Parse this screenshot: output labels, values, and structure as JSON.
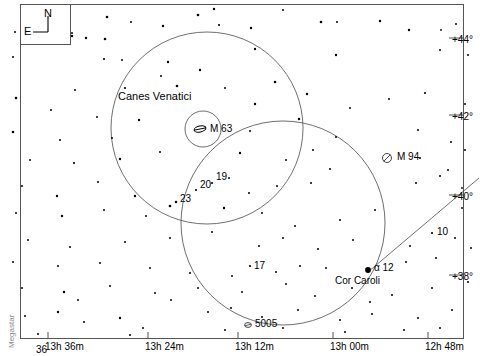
{
  "chart": {
    "width": 488,
    "height": 356,
    "background": "#ffffff",
    "ink": "#000000",
    "watermark": "Megastar"
  },
  "compass": {
    "north_label": "N",
    "east_label": "E"
  },
  "constellation": {
    "name": "Canes Venatici"
  },
  "deep_sky": [
    {
      "id": "m63",
      "label": "M 63",
      "symbol": "galaxy-edge-on",
      "x": 200,
      "y": 129,
      "label_x": 210,
      "label_y": 124
    },
    {
      "id": "m94",
      "label": "M 94",
      "symbol": "galaxy-slashed",
      "x": 387,
      "y": 158,
      "label_x": 397,
      "label_y": 152
    },
    {
      "id": "n5005",
      "label": "5005",
      "symbol": "galaxy-small",
      "x": 248,
      "y": 325,
      "label_x": 255,
      "label_y": 319
    }
  ],
  "stars_labeled": [
    {
      "label": "19",
      "x": 212,
      "y": 183,
      "mag": 5.4,
      "label_x": 216,
      "label_y": 172
    },
    {
      "label": "20",
      "x": 196,
      "y": 190,
      "mag": 5.2,
      "label_x": 200,
      "label_y": 180
    },
    {
      "label": "23",
      "x": 176,
      "y": 202,
      "mag": 5.0,
      "label_x": 180,
      "label_y": 194
    },
    {
      "label": "17",
      "x": 250,
      "y": 266,
      "mag": 5.4,
      "label_x": 254,
      "label_y": 261
    },
    {
      "label": "10",
      "x": 432,
      "y": 233,
      "mag": 5.9,
      "label_x": 437,
      "label_y": 227
    },
    {
      "label": "α  12",
      "x": 368,
      "y": 270,
      "mag": 2.9,
      "label_x": 374,
      "label_y": 263
    }
  ],
  "named_stars": [
    {
      "name": "Cor Caroli",
      "x": 368,
      "y": 270,
      "label_x": 335,
      "label_y": 276
    }
  ],
  "axis_ra": {
    "label": "Right Ascension",
    "ticks": [
      {
        "text": "13h 36m",
        "x": 48,
        "y": 342
      },
      {
        "text": "13h 24m",
        "x": 148,
        "y": 342
      },
      {
        "text": "13h 12m",
        "x": 238,
        "y": 342
      },
      {
        "text": "13h 00m",
        "x": 333,
        "y": 342
      },
      {
        "text": "12h 48m",
        "x": 428,
        "y": 342
      }
    ],
    "extra_tick": {
      "text": "36",
      "x": 36,
      "y": 345
    }
  },
  "axis_dec": {
    "label": "Declination",
    "ticks": [
      {
        "text": "+44°",
        "x": 452,
        "y": 35
      },
      {
        "text": "+42°",
        "x": 452,
        "y": 112
      },
      {
        "text": "+40°",
        "x": 452,
        "y": 192
      },
      {
        "text": "+38°",
        "x": 452,
        "y": 272
      }
    ]
  },
  "circles": [
    {
      "id": "field-circle-left",
      "cx": 207,
      "cy": 128,
      "r": 96
    },
    {
      "id": "field-circle-right",
      "cx": 283,
      "cy": 223,
      "r": 102
    },
    {
      "id": "m63-circle",
      "cx": 203,
      "cy": 129,
      "r": 18
    }
  ],
  "boundary_line": {
    "x1": 368,
    "y1": 272,
    "x2": 479,
    "y2": 178
  },
  "starfield": [
    [
      214,
      9,
      1.2
    ],
    [
      283,
      10,
      1.0
    ],
    [
      107,
      17,
      1.3
    ],
    [
      131,
      22,
      1.0
    ],
    [
      198,
      15,
      1.3
    ],
    [
      321,
      22,
      1.3
    ],
    [
      380,
      21,
      1.2
    ],
    [
      409,
      30,
      1.2
    ],
    [
      72,
      36,
      1.2
    ],
    [
      105,
      39,
      1.3
    ],
    [
      163,
      26,
      1.2
    ],
    [
      251,
      28,
      1.2
    ],
    [
      337,
      22,
      1.0
    ],
    [
      441,
      30,
      0.9
    ],
    [
      15,
      32,
      1.0
    ],
    [
      72,
      33,
      1.0
    ],
    [
      86,
      38,
      1.2
    ],
    [
      219,
      25,
      1.1
    ],
    [
      456,
      24,
      1.0
    ],
    [
      168,
      62,
      1.2
    ],
    [
      122,
      60,
      1.0
    ],
    [
      255,
      49,
      1.2
    ],
    [
      161,
      76,
      1.0
    ],
    [
      200,
      70,
      1.2
    ],
    [
      13,
      57,
      1.0
    ],
    [
      104,
      59,
      1.1
    ],
    [
      336,
      55,
      1.2
    ],
    [
      440,
      50,
      1.0
    ],
    [
      468,
      55,
      1.0
    ],
    [
      75,
      90,
      1.0
    ],
    [
      125,
      88,
      1.1
    ],
    [
      177,
      86,
      1.3
    ],
    [
      225,
      88,
      1.0
    ],
    [
      275,
      82,
      1.3
    ],
    [
      16,
      98,
      1.3
    ],
    [
      51,
      110,
      1.0
    ],
    [
      97,
      117,
      1.0
    ],
    [
      139,
      120,
      1.2
    ],
    [
      255,
      104,
      1.2
    ],
    [
      307,
      94,
      1.2
    ],
    [
      350,
      108,
      1.0
    ],
    [
      389,
      99,
      1.0
    ],
    [
      425,
      93,
      1.1
    ],
    [
      465,
      104,
      1.0
    ],
    [
      13,
      132,
      1.3
    ],
    [
      60,
      140,
      1.0
    ],
    [
      112,
      138,
      1.0
    ],
    [
      250,
      131,
      1.0
    ],
    [
      299,
      119,
      1.2
    ],
    [
      336,
      137,
      1.0
    ],
    [
      418,
      130,
      1.0
    ],
    [
      451,
      142,
      1.0
    ],
    [
      30,
      160,
      1.0
    ],
    [
      74,
      163,
      1.1
    ],
    [
      120,
      159,
      1.2
    ],
    [
      160,
      152,
      1.0
    ],
    [
      240,
      153,
      1.2
    ],
    [
      286,
      160,
      1.0
    ],
    [
      313,
      150,
      1.0
    ],
    [
      330,
      169,
      1.0
    ],
    [
      420,
      158,
      1.0
    ],
    [
      465,
      150,
      1.0
    ],
    [
      22,
      186,
      1.0
    ],
    [
      57,
      196,
      1.2
    ],
    [
      98,
      182,
      1.0
    ],
    [
      135,
      196,
      1.2
    ],
    [
      229,
      178,
      1.0
    ],
    [
      249,
      193,
      1.0
    ],
    [
      277,
      186,
      1.0
    ],
    [
      311,
      183,
      1.0
    ],
    [
      416,
      183,
      1.0
    ],
    [
      440,
      176,
      1.0
    ],
    [
      448,
      170,
      1.0
    ],
    [
      462,
      188,
      0.9
    ],
    [
      16,
      213,
      1.0
    ],
    [
      62,
      216,
      1.2
    ],
    [
      104,
      210,
      1.0
    ],
    [
      146,
      216,
      1.0
    ],
    [
      170,
      206,
      1.3
    ],
    [
      224,
      208,
      1.2
    ],
    [
      262,
      213,
      1.0
    ],
    [
      295,
      226,
      1.0
    ],
    [
      340,
      220,
      1.0
    ],
    [
      375,
      210,
      1.0
    ],
    [
      462,
      208,
      0.9
    ],
    [
      28,
      240,
      1.0
    ],
    [
      70,
      247,
      1.0
    ],
    [
      125,
      242,
      1.0
    ],
    [
      170,
      238,
      1.0
    ],
    [
      212,
      232,
      1.0
    ],
    [
      259,
      246,
      1.0
    ],
    [
      283,
      238,
      1.0
    ],
    [
      318,
      249,
      1.0
    ],
    [
      353,
      240,
      1.0
    ],
    [
      410,
      246,
      1.0
    ],
    [
      455,
      238,
      1.0
    ],
    [
      13,
      262,
      1.0
    ],
    [
      58,
      266,
      1.0
    ],
    [
      100,
      263,
      1.0
    ],
    [
      150,
      268,
      1.0
    ],
    [
      190,
      273,
      1.0
    ],
    [
      232,
      276,
      1.0
    ],
    [
      276,
      272,
      1.0
    ],
    [
      300,
      266,
      1.0
    ],
    [
      326,
      268,
      1.0
    ],
    [
      406,
      262,
      1.0
    ],
    [
      436,
      258,
      1.0
    ],
    [
      471,
      248,
      1.0
    ],
    [
      22,
      288,
      1.0
    ],
    [
      64,
      292,
      1.2
    ],
    [
      110,
      286,
      1.0
    ],
    [
      155,
      293,
      1.0
    ],
    [
      198,
      288,
      1.0
    ],
    [
      242,
      292,
      1.0
    ],
    [
      286,
      284,
      1.0
    ],
    [
      315,
      296,
      1.0
    ],
    [
      352,
      288,
      1.0
    ],
    [
      392,
      295,
      1.0
    ],
    [
      432,
      288,
      1.0
    ],
    [
      468,
      282,
      1.0
    ],
    [
      25,
      316,
      1.0
    ],
    [
      58,
      312,
      1.2
    ],
    [
      84,
      322,
      1.0
    ],
    [
      120,
      318,
      1.2
    ],
    [
      143,
      328,
      1.0
    ],
    [
      208,
      312,
      1.0
    ],
    [
      231,
      308,
      1.0
    ],
    [
      262,
      317,
      1.0
    ],
    [
      298,
      310,
      1.0
    ],
    [
      340,
      320,
      1.0
    ],
    [
      372,
      314,
      1.0
    ],
    [
      418,
      318,
      1.0
    ],
    [
      452,
      310,
      1.0
    ],
    [
      78,
      300,
      1.0
    ],
    [
      171,
      300,
      1.0
    ],
    [
      370,
      302,
      1.0
    ],
    [
      225,
      330,
      1.0
    ],
    [
      130,
      335,
      1.0
    ],
    [
      283,
      328,
      1.0
    ],
    [
      440,
      328,
      1.0
    ],
    [
      404,
      330,
      1.0
    ],
    [
      38,
      334,
      1.0
    ],
    [
      345,
      332,
      1.0
    ]
  ]
}
